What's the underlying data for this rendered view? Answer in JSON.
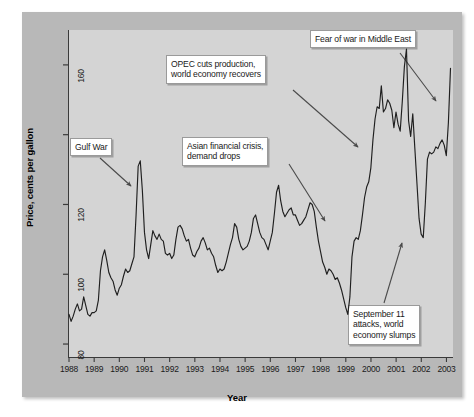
{
  "chart_data": {
    "type": "line",
    "title": "",
    "xlabel": "Year",
    "ylabel": "Price, cents per gallon",
    "xlim": [
      1988.0,
      2003.3
    ],
    "ylim": [
      76,
      170
    ],
    "grid": false,
    "legend": "none",
    "xticks": [
      "1988",
      "1989",
      "1990",
      "1991",
      "1992",
      "1993",
      "1994",
      "1995",
      "1996",
      "1997",
      "1998",
      "1999",
      "2000",
      "2001",
      "2002",
      "2003"
    ],
    "yticks": [
      80,
      100,
      120,
      140,
      160
    ],
    "series": [
      {
        "name": "Retail gasoline price",
        "units": "cents per gallon",
        "x_start": 1988.04,
        "x_step_years": 0.0833,
        "values": [
          88.5,
          86.5,
          88.0,
          90.0,
          91.5,
          89.5,
          90.0,
          93.5,
          91.0,
          88.5,
          88.0,
          89.0,
          89.0,
          89.5,
          92.5,
          101.0,
          105.0,
          107.0,
          104.0,
          100.5,
          99.0,
          98.0,
          95.5,
          94.0,
          96.0,
          97.0,
          99.5,
          101.5,
          100.5,
          101.0,
          103.0,
          105.0,
          117.0,
          131.0,
          132.5,
          124.0,
          112.0,
          107.0,
          104.5,
          108.5,
          112.5,
          111.0,
          110.0,
          111.5,
          110.0,
          109.5,
          106.0,
          105.5,
          106.0,
          104.5,
          105.5,
          110.0,
          113.5,
          114.0,
          113.0,
          111.0,
          109.5,
          110.0,
          107.5,
          105.5,
          105.0,
          106.5,
          107.5,
          109.5,
          110.5,
          109.0,
          107.0,
          107.5,
          106.0,
          105.0,
          102.5,
          100.5,
          101.5,
          101.0,
          101.5,
          103.5,
          106.0,
          108.5,
          110.5,
          114.5,
          113.5,
          110.0,
          108.0,
          107.0,
          107.5,
          108.0,
          109.5,
          112.0,
          116.0,
          117.0,
          114.5,
          112.0,
          110.5,
          110.0,
          108.5,
          107.0,
          109.5,
          112.0,
          117.5,
          123.5,
          125.5,
          121.0,
          118.0,
          116.5,
          117.5,
          118.5,
          119.0,
          117.0,
          117.0,
          115.5,
          114.0,
          114.5,
          115.5,
          116.5,
          118.5,
          120.5,
          120.0,
          118.0,
          113.5,
          109.5,
          106.5,
          103.5,
          102.0,
          100.0,
          101.5,
          101.0,
          100.0,
          98.5,
          99.0,
          97.5,
          95.5,
          93.0,
          90.5,
          88.5,
          93.5,
          105.0,
          109.5,
          110.5,
          110.0,
          112.5,
          117.0,
          122.0,
          125.0,
          126.5,
          130.5,
          138.5,
          144.5,
          148.0,
          147.5,
          154.0,
          146.5,
          147.5,
          150.0,
          149.0,
          147.0,
          142.0,
          146.5,
          143.0,
          141.0,
          149.5,
          159.5,
          164.5,
          144.0,
          139.5,
          146.0,
          136.0,
          126.0,
          116.0,
          111.5,
          110.5,
          120.5,
          133.0,
          135.0,
          134.5,
          135.0,
          136.5,
          136.0,
          137.5,
          138.5,
          137.0,
          134.0,
          143.5,
          159.0
        ]
      }
    ],
    "annotations": [
      {
        "id": "gulf-war",
        "text": "Gulf War",
        "box_x": 70,
        "box_y": 138,
        "arrow_from_x": 100,
        "arrow_from_y": 158,
        "arrow_to_x": 131,
        "arrow_to_y": 186
      },
      {
        "id": "asian-financial-crisis",
        "text": "Asian financial crisis,\ndemand drops",
        "box_x": 182,
        "box_y": 137,
        "arrow_from_x": 289,
        "arrow_from_y": 164,
        "arrow_to_x": 325,
        "arrow_to_y": 221
      },
      {
        "id": "opec-cuts-production",
        "text": "OPEC cuts production,\nworld economy recovers",
        "box_x": 166,
        "box_y": 55,
        "arrow_from_x": 293,
        "arrow_from_y": 90,
        "arrow_to_x": 358,
        "arrow_to_y": 147
      },
      {
        "id": "fear-of-war-middle-east",
        "text": "Fear of war in Middle East",
        "box_x": 310,
        "box_y": 30,
        "arrow_from_x": 400,
        "arrow_from_y": 53,
        "arrow_to_x": 436,
        "arrow_to_y": 101
      },
      {
        "id": "september-11-attacks",
        "text": "September 11\nattacks, world\neconomy slumps",
        "box_x": 348,
        "box_y": 305,
        "arrow_from_x": 384,
        "arrow_from_y": 303,
        "arrow_to_x": 402,
        "arrow_to_y": 243
      }
    ],
    "colors": {
      "line": "#1f1f1f",
      "plot_background": "#d4d4d4",
      "panel_background": "#b8b8b8",
      "axis": "#3a3a3a",
      "annotation_box_background": "#ffffff",
      "annotation_text": "#1a1a1a",
      "arrow": "#4a4a4a"
    }
  }
}
